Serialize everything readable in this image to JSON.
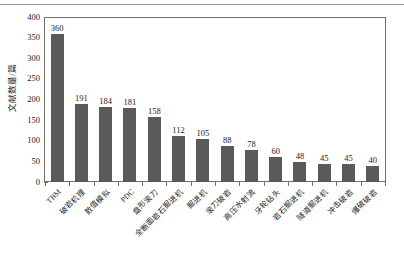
{
  "figure": {
    "ylabel": "文献数量/篇",
    "yticks": [
      "0",
      "50",
      "100",
      "150",
      "200",
      "250",
      "300",
      "350",
      "400"
    ]
  },
  "chart_data": {
    "type": "bar",
    "title": "",
    "xlabel": "",
    "ylabel": "文献数量/篇",
    "ylim": [
      0,
      400
    ],
    "ytick_values": [
      0,
      50,
      100,
      150,
      200,
      250,
      300,
      350,
      400
    ],
    "grid": false,
    "legend": false,
    "bar_color": "#5a5a5a",
    "categories": [
      "TBM",
      "破岩机理",
      "数值模拟",
      "PDC",
      "盘形滚刀",
      "全断面岩石掘进机",
      "掘进机",
      "滚刀破岩",
      "高压水射流",
      "牙轮钻头",
      "岩石掘进机",
      "隧道掘进机",
      "冲击破岩",
      "爆破破岩"
    ],
    "values": [
      360,
      191,
      184,
      181,
      158,
      112,
      105,
      88,
      78,
      60,
      48,
      45,
      45,
      40
    ],
    "data_labels": [
      "360",
      "191",
      "184",
      "181",
      "158",
      "112",
      "105",
      "88",
      "78",
      "60",
      "48",
      "45",
      "45",
      "40"
    ]
  }
}
